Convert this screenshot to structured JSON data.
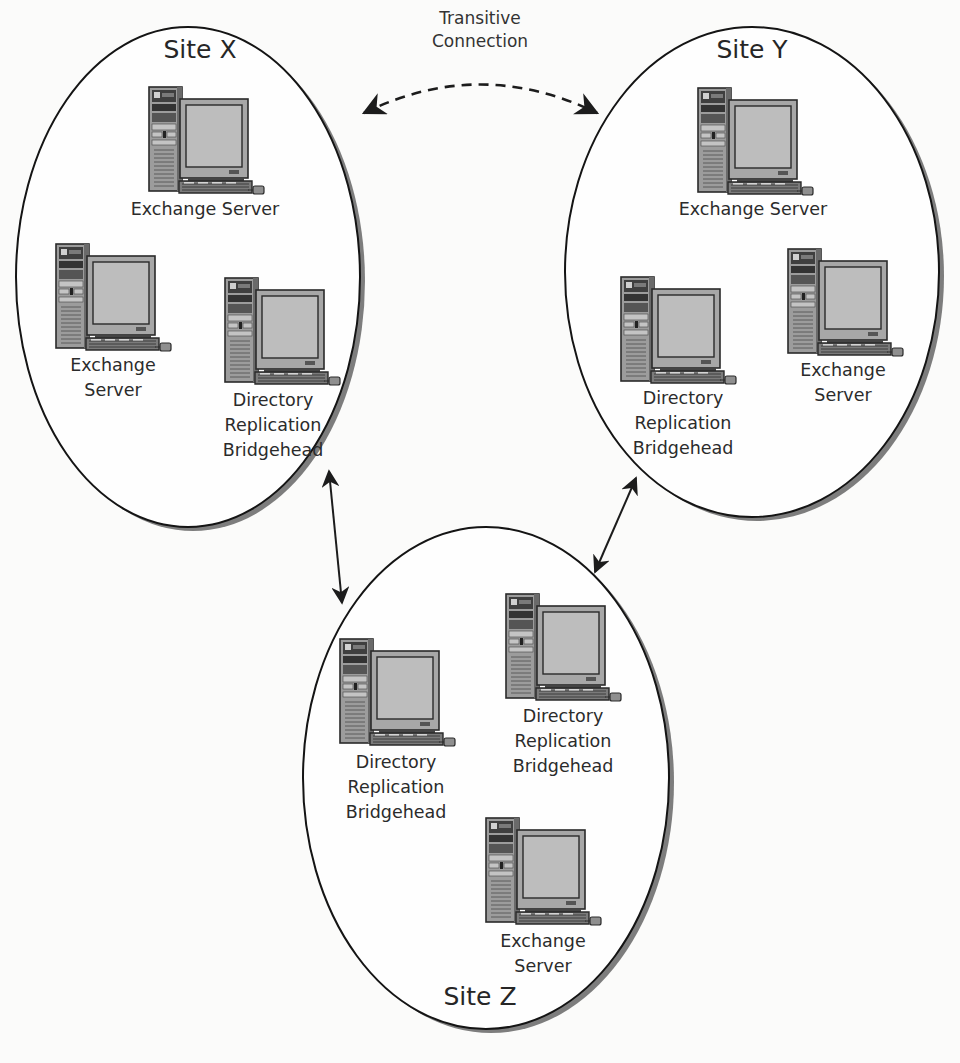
{
  "diagram": {
    "type": "network-topology",
    "colors": {
      "background": "#fbfbfa",
      "ellipse_stroke": "#141414",
      "ellipse_shadow": "#7d7d7d",
      "ellipse_fill": "#ffffff",
      "computer_body": "#9a9a9a",
      "computer_dark": "#555555",
      "computer_screen": "#b8b8b8",
      "arrow": "#1c1c1c"
    },
    "sites": [
      {
        "id": "site-x",
        "title": "Site X",
        "ellipse": {
          "cx": 188,
          "cy": 277,
          "rx": 172,
          "ry": 250
        },
        "title_pos": {
          "x": 200,
          "y": 58
        },
        "nodes": [
          {
            "role": "exchange-server",
            "x": 148,
            "y": 86,
            "label_lines": [
              "Exchange Server"
            ],
            "label_x": 205,
            "label_y": 215
          },
          {
            "role": "exchange-server",
            "x": 55,
            "y": 243,
            "label_lines": [
              "Exchange",
              "Server"
            ],
            "label_x": 113,
            "label_y": 371
          },
          {
            "role": "directory-replication-bridgehead",
            "x": 224,
            "y": 277,
            "label_lines": [
              "Directory",
              "Replication",
              "Bridgehead"
            ],
            "label_x": 273,
            "label_y": 406
          }
        ]
      },
      {
        "id": "site-y",
        "title": "Site Y",
        "ellipse": {
          "cx": 752,
          "cy": 272,
          "rx": 187,
          "ry": 245
        },
        "title_pos": {
          "x": 752,
          "y": 58
        },
        "nodes": [
          {
            "role": "exchange-server",
            "x": 697,
            "y": 87,
            "label_lines": [
              "Exchange Server"
            ],
            "label_x": 753,
            "label_y": 215
          },
          {
            "role": "directory-replication-bridgehead",
            "x": 620,
            "y": 276,
            "label_lines": [
              "Directory",
              "Replication",
              "Bridgehead"
            ],
            "label_x": 683,
            "label_y": 404
          },
          {
            "role": "exchange-server",
            "x": 787,
            "y": 248,
            "label_lines": [
              "Exchange",
              "Server"
            ],
            "label_x": 843,
            "label_y": 376
          }
        ]
      },
      {
        "id": "site-z",
        "title": "Site Z",
        "ellipse": {
          "cx": 486,
          "cy": 778,
          "rx": 183,
          "ry": 251
        },
        "title_pos": {
          "x": 480,
          "y": 1005
        },
        "nodes": [
          {
            "role": "directory-replication-bridgehead",
            "x": 339,
            "y": 638,
            "label_lines": [
              "Directory",
              "Replication",
              "Bridgehead"
            ],
            "label_x": 396,
            "label_y": 768
          },
          {
            "role": "directory-replication-bridgehead",
            "x": 505,
            "y": 593,
            "label_lines": [
              "Directory",
              "Replication",
              "Bridgehead"
            ],
            "label_x": 563,
            "label_y": 722
          },
          {
            "role": "exchange-server",
            "x": 485,
            "y": 817,
            "label_lines": [
              "Exchange",
              "Server"
            ],
            "label_x": 543,
            "label_y": 947
          }
        ]
      }
    ],
    "connections": [
      {
        "id": "transitive-connection",
        "from": "site-x",
        "to": "site-y",
        "style": "dashed",
        "bidirectional": true,
        "path": "M 362 112 Q 480 60 597 112",
        "label_lines": [
          "Transitive",
          "Connection"
        ],
        "label_x": 480,
        "label_y": 44
      },
      {
        "id": "x-z-link",
        "from": "site-x",
        "to": "site-z",
        "style": "solid",
        "bidirectional": true,
        "x1": 329,
        "y1": 470,
        "x2": 342,
        "y2": 603
      },
      {
        "id": "y-z-link",
        "from": "site-y",
        "to": "site-z",
        "style": "solid",
        "bidirectional": true,
        "x1": 636,
        "y1": 477,
        "x2": 595,
        "y2": 572
      }
    ]
  }
}
